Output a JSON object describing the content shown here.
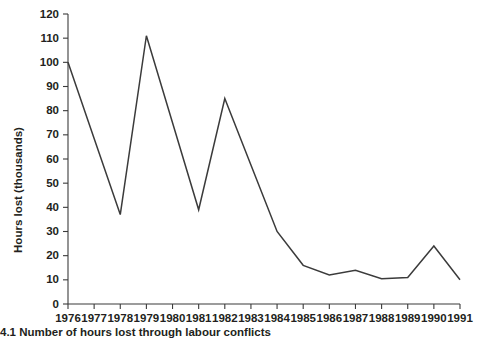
{
  "caption": "4.1  Number of hours lost through labour conflicts",
  "chart_data": {
    "type": "line",
    "title": "",
    "xlabel": "",
    "ylabel": "Hours lost (thousands)",
    "categories": [
      "1976",
      "1977",
      "1978",
      "1979",
      "1980",
      "1981",
      "1982",
      "1983",
      "1984",
      "1985",
      "1986",
      "1987",
      "1988",
      "1989",
      "1990",
      "1991"
    ],
    "x": [
      1976,
      1977,
      1978,
      1979,
      1980,
      1981,
      1982,
      1983,
      1984,
      1985,
      1986,
      1987,
      1988,
      1989,
      1990,
      1991
    ],
    "values": [
      100,
      68.5,
      37,
      111,
      75,
      39,
      85,
      57.5,
      30,
      16,
      12,
      14,
      10.5,
      11,
      24,
      10
    ],
    "ylim": [
      0,
      120
    ],
    "yticks": [
      0,
      10,
      20,
      30,
      40,
      50,
      60,
      70,
      80,
      90,
      100,
      110,
      120
    ],
    "ytick_labels": [
      "0",
      "10",
      "20",
      "30",
      "40",
      "50",
      "60",
      "70",
      "80",
      "90",
      "100",
      "110",
      "120"
    ],
    "xtick_labels": [
      "1976",
      "1977",
      "1978",
      "1979",
      "1980",
      "1981",
      "1982",
      "1983",
      "1984",
      "1985",
      "1986",
      "1987",
      "1988",
      "1989",
      "1990",
      "1991"
    ],
    "grid": false,
    "legend": false,
    "line_color": "#3b3b3b",
    "axis_color": "#3b3b3b"
  }
}
